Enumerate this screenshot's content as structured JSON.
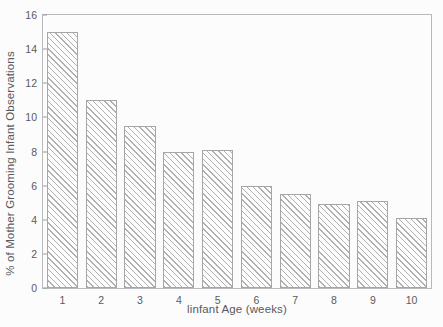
{
  "chart_data": {
    "type": "bar",
    "title": "",
    "xlabel": "linfant Age (weeks)",
    "ylabel": "% of Mother Grooming Infant Observations",
    "categories": [
      "1",
      "2",
      "3",
      "4",
      "5",
      "6",
      "7",
      "8",
      "9",
      "10"
    ],
    "values": [
      15,
      11,
      9.5,
      8,
      8.1,
      6,
      5.5,
      4.9,
      5.1,
      4.1
    ],
    "ylim": [
      0,
      16
    ],
    "yticks": [
      "0",
      "2",
      "4",
      "6",
      "8",
      "10",
      "12",
      "14",
      "16"
    ],
    "ytick_values": [
      0,
      2,
      4,
      6,
      8,
      10,
      12,
      14,
      16
    ],
    "grid": false,
    "legend": false,
    "bar_edge_color": "#a6a6a8",
    "bar_hatch_color": "#b0b0b2",
    "frame_color": "#b9b9bb",
    "background_color": "#fcfcfc",
    "text_color": "#5a5a5c"
  }
}
